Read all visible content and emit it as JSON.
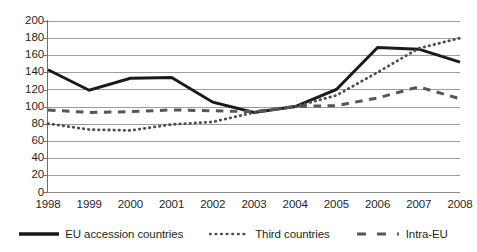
{
  "chart_data": {
    "type": "line",
    "title": "",
    "xlabel": "",
    "ylabel": "",
    "categories": [
      "1998",
      "1999",
      "2000",
      "2001",
      "2002",
      "2003",
      "2004",
      "2005",
      "2006",
      "2007",
      "2008"
    ],
    "ylim": [
      0,
      200
    ],
    "y_ticks": [
      0,
      20,
      40,
      60,
      80,
      100,
      120,
      140,
      160,
      180,
      200
    ],
    "grid": true,
    "legend_position": "bottom",
    "series": [
      {
        "name": "EU accession countries",
        "style": "solid",
        "color": "#1a1a1a",
        "values": [
          143,
          119,
          133,
          134,
          105,
          93,
          100,
          120,
          169,
          167,
          152
        ]
      },
      {
        "name": "Third countries",
        "style": "dotted",
        "color": "#4d4d4d",
        "values": [
          80,
          73,
          72,
          79,
          82,
          93,
          100,
          113,
          140,
          168,
          180
        ]
      },
      {
        "name": "Intra-EU",
        "style": "dashed",
        "color": "#565656",
        "values": [
          96,
          93,
          94,
          96,
          95,
          94,
          100,
          101,
          110,
          123,
          109
        ]
      }
    ]
  },
  "axis": {
    "y_tick_labels": [
      "200",
      "180",
      "160",
      "140",
      "120",
      "100",
      "80",
      "60",
      "40",
      "20",
      "0"
    ],
    "x_tick_labels": [
      "1998",
      "1999",
      "2000",
      "2001",
      "2002",
      "2003",
      "2004",
      "2005",
      "2006",
      "2007",
      "2008"
    ]
  },
  "legend": {
    "items": [
      {
        "label": "EU accession countries",
        "style": "solid"
      },
      {
        "label": "Third countries",
        "style": "dotted"
      },
      {
        "label": "Intra-EU",
        "style": "dashed"
      }
    ]
  }
}
